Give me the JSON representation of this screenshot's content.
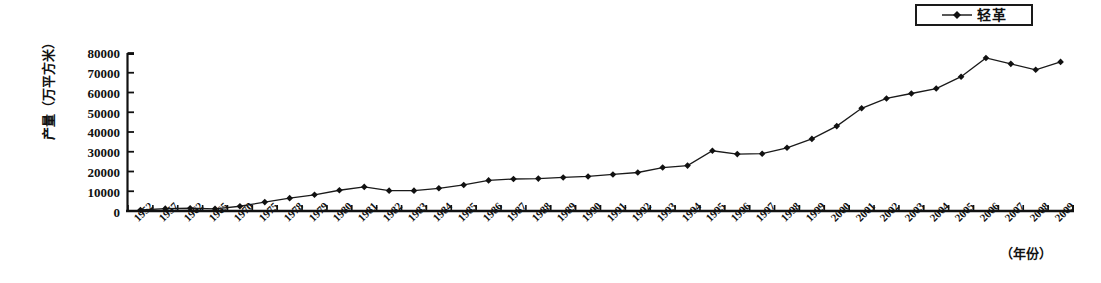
{
  "chart_data": {
    "type": "line",
    "title": "",
    "xlabel": "（年份）",
    "ylabel": "产量（万平方米）",
    "ylim": [
      0,
      80000
    ],
    "ytick_labels": [
      "80000",
      "70000",
      "60000",
      "50000",
      "40000",
      "30000",
      "20000",
      "10000",
      "0"
    ],
    "ytick_values": [
      80000,
      70000,
      60000,
      50000,
      40000,
      30000,
      20000,
      10000,
      0
    ],
    "grid": false,
    "legend_position": "top-right",
    "legend": [
      "轻革"
    ],
    "categories": [
      "1952",
      "1957",
      "1962",
      "1965",
      "1970",
      "1975",
      "1978",
      "1979",
      "1980",
      "1981",
      "1982",
      "1983",
      "1984",
      "1985",
      "1986",
      "1987",
      "1988",
      "1989",
      "1990",
      "1991",
      "1992",
      "1993",
      "1994",
      "1995",
      "1996",
      "1997",
      "1998",
      "1999",
      "2000",
      "2001",
      "2002",
      "2003",
      "2004",
      "2005",
      "2006",
      "2007",
      "2008",
      "2009"
    ],
    "series": [
      {
        "name": "轻革",
        "marker": "diamond",
        "color": "#000000",
        "values": [
          500,
          1200,
          1400,
          1100,
          2400,
          4500,
          6500,
          8200,
          10500,
          12200,
          10300,
          10300,
          11500,
          13200,
          15500,
          16200,
          16400,
          17000,
          17500,
          18500,
          19500,
          22000,
          23000,
          30500,
          28800,
          29000,
          32000,
          36500,
          43000,
          52000,
          57000,
          59500,
          62000,
          68000,
          77500,
          74500,
          71500,
          75500
        ]
      }
    ]
  },
  "legend_entry": {
    "label": "轻革",
    "marker_icon": "diamond-marker-icon"
  },
  "axis": {
    "y_title": "产量（万平方米）",
    "x_title": "（年份）"
  }
}
